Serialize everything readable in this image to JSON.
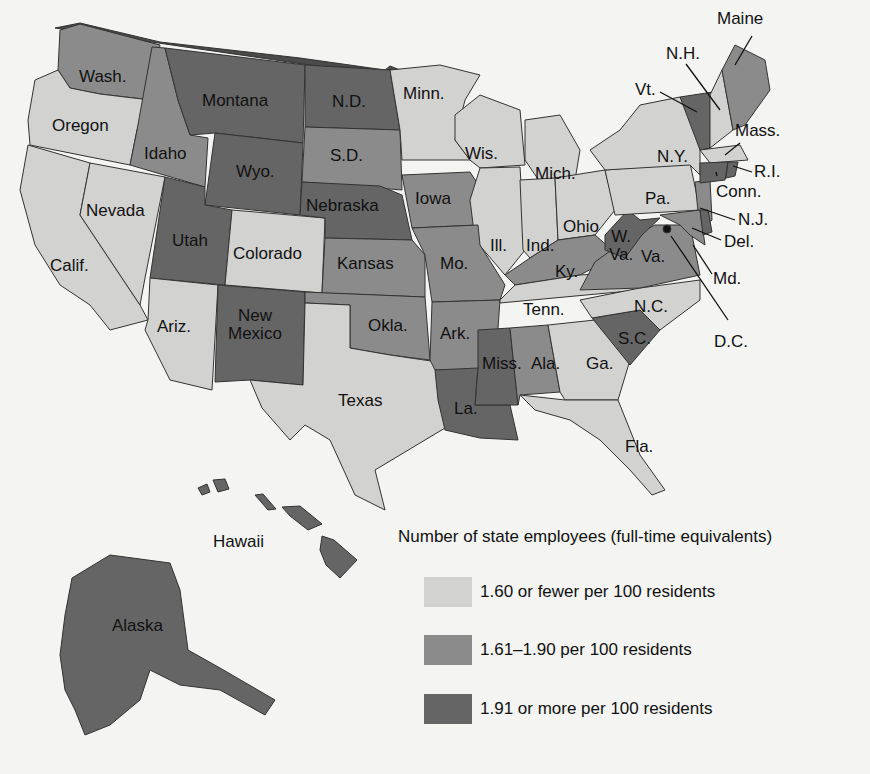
{
  "legend": {
    "title": "Number of state employees (full-time equivalents)",
    "categories": [
      {
        "label": "1.60 or fewer per 100 residents",
        "color": "#d2d2d0"
      },
      {
        "label": "1.61–1.90 per 100 residents",
        "color": "#8b8b8b"
      },
      {
        "label": "1.91 or more per 100 residents",
        "color": "#656565"
      }
    ]
  },
  "states": {
    "low": [
      "Oregon",
      "Calif.",
      "Nevada",
      "Colorado",
      "Ariz.",
      "Texas",
      "Minn.",
      "Wis.",
      "Mich.",
      "Ill.",
      "Ind.",
      "Ohio",
      "Tenn.",
      "Ga.",
      "Fla.",
      "N.C.",
      "Pa.",
      "N.Y.",
      "N.H.",
      "Mass."
    ],
    "mid": [
      "Wash.",
      "Idaho",
      "S.D.",
      "Iowa",
      "Kansas",
      "Okla.",
      "Mo.",
      "Ark.",
      "Ky.",
      "Ala.",
      "Va.",
      "Maine",
      "N.J.",
      "Md."
    ],
    "high": [
      "Montana",
      "N.D.",
      "Wyo.",
      "Utah",
      "New Mexico",
      "Nebraska",
      "La.",
      "Miss.",
      "S.C.",
      "W. Va.",
      "Vt.",
      "Conn.",
      "R.I.",
      "Del.",
      "Alaska",
      "Hawaii"
    ]
  },
  "labels": {
    "wash": "Wash.",
    "oregon": "Oregon",
    "calif": "Calif.",
    "nevada": "Nevada",
    "idaho": "Idaho",
    "montana": "Montana",
    "wyo": "Wyo.",
    "utah": "Utah",
    "ariz": "Ariz.",
    "colorado": "Colorado",
    "nm1": "New",
    "nm2": "Mexico",
    "nd": "N.D.",
    "sd": "S.D.",
    "nebraska": "Nebraska",
    "kansas": "Kansas",
    "okla": "Okla.",
    "texas": "Texas",
    "minn": "Minn.",
    "iowa": "Iowa",
    "mo": "Mo.",
    "ark": "Ark.",
    "la": "La.",
    "wis": "Wis.",
    "ill": "Ill.",
    "mich": "Mich.",
    "ind": "Ind.",
    "ohio": "Ohio",
    "ky": "Ky.",
    "tenn": "Tenn.",
    "miss": "Miss.",
    "ala": "Ala.",
    "ga": "Ga.",
    "fla": "Fla.",
    "sc": "S.C.",
    "nc": "N.C.",
    "va": "Va.",
    "wv1": "W.",
    "wv2": "Va.",
    "pa": "Pa.",
    "ny": "N.Y.",
    "maine": "Maine",
    "nh": "N.H.",
    "vt": "Vt.",
    "mass": "Mass.",
    "ri": "R.I.",
    "conn": "Conn.",
    "nj": "N.J.",
    "del": "Del.",
    "md": "Md.",
    "dc": "D.C.",
    "hawaii": "Hawaii",
    "alaska": "Alaska"
  }
}
